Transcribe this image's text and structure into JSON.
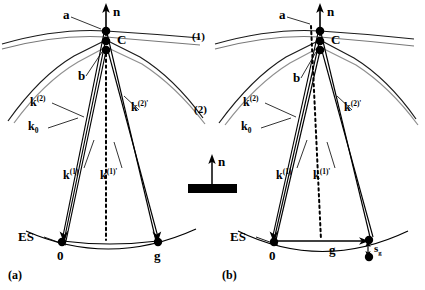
{
  "figure": {
    "type": "ewald-sphere-construction",
    "panels": [
      {
        "id": "a",
        "caption": "(a)",
        "labels": {
          "normal": "n",
          "node_a": "a",
          "node_b": "b",
          "center": "C",
          "branch_1": "(1)",
          "branch_2": "(2)",
          "ewald_sphere": "ES",
          "origin": "0",
          "g_node": "g",
          "k0": "k",
          "k0_sub": "0",
          "k2": "k",
          "k2_sup": "(2)",
          "k2p": "k",
          "k2p_sup": "(2)'",
          "k1": "k",
          "k1_sup": "(1)",
          "k1p": "k",
          "k1p_sup": "(1)'"
        }
      },
      {
        "id": "b",
        "caption": "(b)",
        "labels": {
          "normal": "n",
          "node_a": "a",
          "node_b": "b",
          "center": "C",
          "ewald_sphere": "ES",
          "origin": "0",
          "g_vector": "g",
          "excitation_error": "s",
          "excitation_error_sub": "g",
          "k0": "k",
          "k0_sub": "0",
          "k2": "k",
          "k2_sup": "(2)",
          "k2p": "k",
          "k2p_sup": "(2)'",
          "k1": "k",
          "k1_sup": "(1)",
          "k1p": "k",
          "k1p_sup": "(1)'"
        }
      }
    ],
    "center_inset": {
      "normal": "n",
      "specimen": "foil-slab"
    },
    "colors": {
      "ink": "#000000",
      "dispersion_light": "#8a8a8a",
      "dispersion_mid": "#5a5a5a",
      "background": "#ffffff"
    }
  }
}
